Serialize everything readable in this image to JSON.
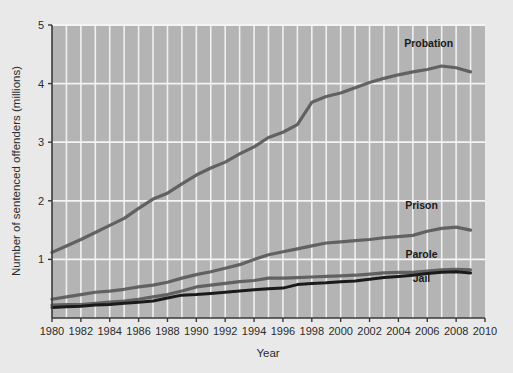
{
  "chart_data": {
    "type": "line",
    "title": "",
    "xlabel": "Year",
    "ylabel": "Number of sentenced offenders (millions)",
    "xlim": [
      1980,
      2010
    ],
    "ylim": [
      0,
      5
    ],
    "grid": true,
    "grid_minor_x_step": 1,
    "legend_position": "inline-right-labels",
    "x_tick_labels": [
      "1980",
      "1982",
      "1984",
      "1986",
      "1988",
      "1990",
      "1992",
      "1994",
      "1996",
      "1998",
      "2000",
      "2002",
      "2004",
      "2006",
      "2008",
      "2010"
    ],
    "x_tick_values": [
      1980,
      1982,
      1984,
      1986,
      1988,
      1990,
      1992,
      1994,
      1996,
      1998,
      2000,
      2002,
      2004,
      2006,
      2008,
      2010
    ],
    "y_tick_labels": [
      "1",
      "2",
      "3",
      "4",
      "5"
    ],
    "y_tick_values": [
      1,
      2,
      3,
      4,
      5
    ],
    "x": [
      1980,
      1981,
      1982,
      1983,
      1984,
      1985,
      1986,
      1987,
      1988,
      1989,
      1990,
      1991,
      1992,
      1993,
      1994,
      1995,
      1996,
      1997,
      1998,
      1999,
      2000,
      2001,
      2002,
      2003,
      2004,
      2005,
      2006,
      2007,
      2008,
      2009
    ],
    "series": [
      {
        "name": "Probation",
        "color": "#5a5a5a",
        "label_x": 2006.1,
        "label_y": 4.62,
        "values": [
          1.12,
          1.23,
          1.34,
          1.46,
          1.58,
          1.7,
          1.87,
          2.03,
          2.13,
          2.29,
          2.44,
          2.56,
          2.66,
          2.8,
          2.92,
          3.08,
          3.17,
          3.3,
          3.68,
          3.78,
          3.84,
          3.93,
          4.02,
          4.09,
          4.15,
          4.2,
          4.24,
          4.3,
          4.27,
          4.2
        ]
      },
      {
        "name": "Prison",
        "color": "#5a5a5a",
        "label_x": 2005.6,
        "label_y": 1.86,
        "values": [
          0.32,
          0.36,
          0.4,
          0.44,
          0.46,
          0.49,
          0.53,
          0.56,
          0.61,
          0.68,
          0.74,
          0.79,
          0.85,
          0.91,
          1.0,
          1.08,
          1.13,
          1.18,
          1.23,
          1.28,
          1.3,
          1.32,
          1.34,
          1.37,
          1.39,
          1.41,
          1.48,
          1.53,
          1.55,
          1.5
        ]
      },
      {
        "name": "Parole",
        "color": "#5a5a5a",
        "label_x": 2005.6,
        "label_y": 1.02,
        "values": [
          0.22,
          0.23,
          0.23,
          0.25,
          0.27,
          0.29,
          0.32,
          0.36,
          0.4,
          0.46,
          0.53,
          0.56,
          0.59,
          0.62,
          0.64,
          0.68,
          0.68,
          0.69,
          0.7,
          0.71,
          0.72,
          0.73,
          0.75,
          0.77,
          0.78,
          0.78,
          0.8,
          0.82,
          0.83,
          0.82
        ]
      },
      {
        "name": "Jail",
        "color": "#1a1a1a",
        "label_x": 2005.6,
        "label_y": 0.62,
        "values": [
          0.18,
          0.19,
          0.2,
          0.22,
          0.23,
          0.25,
          0.27,
          0.29,
          0.34,
          0.39,
          0.4,
          0.42,
          0.44,
          0.46,
          0.48,
          0.5,
          0.51,
          0.57,
          0.59,
          0.6,
          0.62,
          0.63,
          0.66,
          0.69,
          0.71,
          0.73,
          0.76,
          0.78,
          0.79,
          0.77
        ]
      }
    ]
  }
}
